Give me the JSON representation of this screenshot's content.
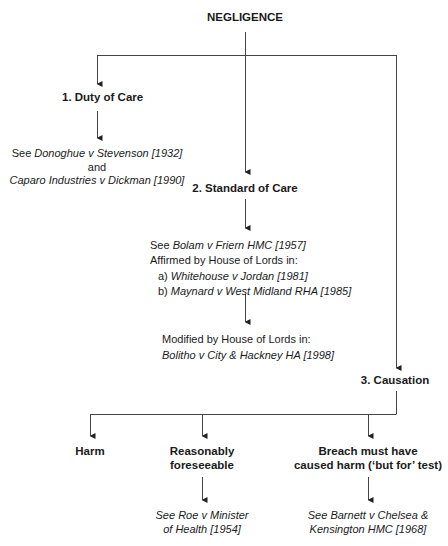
{
  "title": "NEGLIGENCE",
  "duty": {
    "heading": "1. Duty of Care",
    "line1_pre": "See ",
    "line1_case": "Donoghue v Stevenson [1932]",
    "line2": "and",
    "line3_case": "Caparo Industries v Dickman [1990]"
  },
  "standard": {
    "heading": "2. Standard of Care",
    "line1_pre": "See ",
    "line1_case": "Bolam v Friern HMC [1957]",
    "line2": "Affirmed by House of Lords in:",
    "a_pre": "a) ",
    "a_case": "Whitehouse v Jordan [1981]",
    "b_pre": "b) ",
    "b_case": "Maynard v West Midland RHA [1985]",
    "modified": "Modified by House of Lords in:",
    "modified_case": "Bolitho v City & Hackney HA [1998]"
  },
  "causation": {
    "heading": "3. Causation",
    "harm": "Harm",
    "foreseeable_1": "Reasonably",
    "foreseeable_2": "foreseeable",
    "foreseeable_pre": "See ",
    "foreseeable_case_1": "Roe v Minister",
    "foreseeable_case_2": "of Health [1954]",
    "breach_1": "Breach must have",
    "breach_2": "caused harm (‘but for’ test)",
    "breach_pre": "See ",
    "breach_case_1": "Barnett v Chelsea &",
    "breach_case_2": "Kensington HMC [1968]"
  }
}
